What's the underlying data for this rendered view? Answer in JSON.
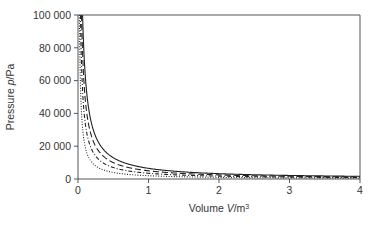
{
  "chart_data": {
    "type": "line",
    "title": "",
    "xlabel": "Volume V/m³",
    "xlabel_parts": {
      "prefix": "Volume ",
      "var": "V",
      "unit": "/m",
      "sup": "3"
    },
    "ylabel": "Pressure p/Pa",
    "ylabel_parts": {
      "prefix": "Pressure ",
      "var": "p",
      "unit": "/Pa"
    },
    "xlim": [
      0,
      4
    ],
    "ylim": [
      0,
      100000
    ],
    "xticks": [
      0,
      1,
      2,
      3,
      4
    ],
    "xtick_labels": [
      "0",
      "1",
      "2",
      "3",
      "4"
    ],
    "yticks": [
      0,
      20000,
      40000,
      60000,
      80000,
      100000
    ],
    "ytick_labels": [
      "0",
      "20 000",
      "40 000",
      "60 000",
      "80 000",
      "100 000"
    ],
    "grid": false,
    "legend": null,
    "series": [
      {
        "name": "isotherm-1 (highest T)",
        "style": "solid",
        "nRT": 6500,
        "x": [
          0.065,
          0.1,
          0.2,
          0.3,
          0.5,
          1,
          2,
          3,
          4
        ],
        "values": [
          100000,
          65000,
          32500,
          21667,
          13000,
          6500,
          3250,
          2167,
          1625
        ]
      },
      {
        "name": "isotherm-2",
        "style": "long-dash",
        "nRT": 5000,
        "x": [
          0.05,
          0.1,
          0.2,
          0.3,
          0.5,
          1,
          2,
          3,
          4
        ],
        "values": [
          100000,
          50000,
          25000,
          16667,
          10000,
          5000,
          2500,
          1667,
          1250
        ]
      },
      {
        "name": "isotherm-3",
        "style": "dash-dot",
        "nRT": 3500,
        "x": [
          0.035,
          0.1,
          0.2,
          0.3,
          0.5,
          1,
          2,
          3,
          4
        ],
        "values": [
          100000,
          35000,
          17500,
          11667,
          7000,
          3500,
          1750,
          1167,
          875
        ]
      },
      {
        "name": "isotherm-4 (lowest T)",
        "style": "dotted",
        "nRT": 2000,
        "x": [
          0.02,
          0.1,
          0.2,
          0.3,
          0.5,
          1,
          2,
          3,
          4
        ],
        "values": [
          100000,
          20000,
          10000,
          6667,
          4000,
          2000,
          1000,
          667,
          500
        ]
      }
    ]
  },
  "layout": {
    "plot_left": 78,
    "plot_right": 360,
    "plot_top": 15,
    "plot_bottom": 179
  }
}
